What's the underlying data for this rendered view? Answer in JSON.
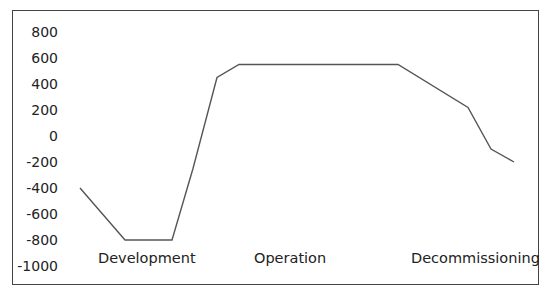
{
  "chart_data": {
    "type": "line",
    "title": "",
    "xlabel": "",
    "ylabel": "",
    "ylim": [
      -1000,
      800
    ],
    "yticks": [
      800,
      600,
      400,
      200,
      0,
      -200,
      -400,
      -600,
      -800,
      -1000
    ],
    "grid": false,
    "legend": null,
    "phase_labels": [
      "Development",
      "Operation",
      "Decommissioning"
    ],
    "series": [
      {
        "name": "value",
        "x": [
          0,
          1,
          2,
          3,
          4,
          5,
          6,
          7,
          8,
          9,
          10
        ],
        "values": [
          -400,
          -800,
          -800,
          -250,
          450,
          550,
          550,
          0,
          0,
          0,
          0
        ]
      }
    ],
    "points": [
      {
        "x": 80,
        "y": -400
      },
      {
        "x": 125,
        "y": -800
      },
      {
        "x": 172,
        "y": -800
      },
      {
        "x": 193,
        "y": -250
      },
      {
        "x": 217,
        "y": 450
      },
      {
        "x": 239,
        "y": 550
      },
      {
        "x": 398,
        "y": 550
      },
      {
        "x": 468,
        "y": 220
      },
      {
        "x": 491,
        "y": -100
      },
      {
        "x": 514,
        "y": -200
      }
    ]
  },
  "labels": {
    "phase_1": "Development",
    "phase_2": "Operation",
    "phase_3": "Decommissioning"
  },
  "colors": {
    "line": "#555555",
    "frame": "#444444",
    "text": "#222222"
  }
}
